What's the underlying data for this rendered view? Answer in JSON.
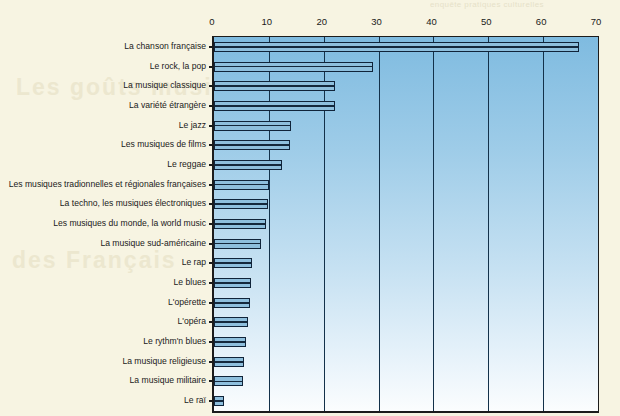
{
  "page": {
    "background_color": "#f7f4e2",
    "cropped_header_text": "enquête pratiques culturelles",
    "watermark_text_1": "Les goûts musicaux",
    "watermark_text_2": "des Français"
  },
  "chart_data": {
    "type": "bar",
    "orientation": "horizontal",
    "title": "",
    "subtitle": "",
    "xlabel": "",
    "ylabel": "",
    "xlim": [
      0,
      70
    ],
    "xticks": [
      0,
      10,
      20,
      30,
      40,
      50,
      60,
      70
    ],
    "xtick_labels": [
      "0",
      "10",
      "20",
      "30",
      "40",
      "50",
      "60",
      "70"
    ],
    "grid": true,
    "grid_axis": "x",
    "legend": false,
    "legend_position": "none",
    "bar_color": "#8ebfdd",
    "bar_edge_color": "#10243a",
    "plot_bg_top_color": "#7fbbe0",
    "plot_bg_bottom_color": "#fbfdfe",
    "gridline_color": "#13314a",
    "categories": [
      "La chanson française",
      "Le rock, la pop",
      "La musique classique",
      "La variété étrangère",
      "Le jazz",
      "Les musiques de films",
      "Le reggae",
      "Les musiques tradionnelles et régionales françaises",
      "La techno, les musiques électroniques",
      "Les musiques du monde, la world music",
      "La musique sud-américaine",
      "Le rap",
      "Le blues",
      "L'opérette",
      "L'opéra",
      "Le rythm'n blues",
      "La musique religieuse",
      "La musique militaire",
      "Le raï"
    ],
    "values": [
      66.5,
      29,
      22,
      22,
      14,
      13.8,
      12.4,
      10,
      9.8,
      9.5,
      8.5,
      7,
      6.8,
      6.5,
      6.2,
      5.8,
      5.5,
      5.3,
      1.8
    ]
  }
}
